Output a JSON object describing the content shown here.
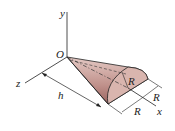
{
  "diagram": {
    "type": "3d-geometry",
    "colors": {
      "cone_fill_dark": "#a9736f",
      "cone_fill_light": "#e4c9c4",
      "base_fill": "#d9b5ae",
      "line": "#222222"
    },
    "labels": {
      "origin": "O",
      "y_axis": "y",
      "z_axis": "z",
      "x_axis": "x",
      "height": "h",
      "radius_face": "R",
      "radius_dim_1": "R",
      "radius_dim_2": "R"
    }
  }
}
